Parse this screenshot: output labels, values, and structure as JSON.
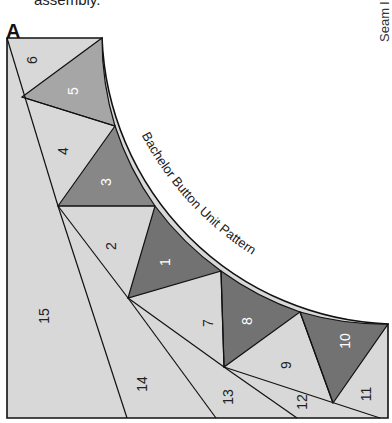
{
  "caption_fragment": "assembly.",
  "side_note": "Seam l",
  "section_label": "A",
  "pattern_title": "Bachelor Button Unit Pattern",
  "colors": {
    "light": "#d8d8d8",
    "medium": "#a6a6a6",
    "medium_dark": "#878787",
    "dark": "#727272",
    "line": "#111111",
    "label_dark_on_light": "#222222",
    "label_light_on_dark": "#ffffff"
  },
  "pieces": [
    {
      "id": "1",
      "label": "1",
      "shade": "dark"
    },
    {
      "id": "2",
      "label": "2",
      "shade": "light"
    },
    {
      "id": "3",
      "label": "3",
      "shade": "medium_dark"
    },
    {
      "id": "4",
      "label": "4",
      "shade": "light"
    },
    {
      "id": "5",
      "label": "5",
      "shade": "medium"
    },
    {
      "id": "6",
      "label": "6",
      "shade": "light"
    },
    {
      "id": "7",
      "label": "7",
      "shade": "light"
    },
    {
      "id": "8",
      "label": "8",
      "shade": "dark"
    },
    {
      "id": "9",
      "label": "9",
      "shade": "light"
    },
    {
      "id": "10",
      "label": "10",
      "shade": "dark"
    },
    {
      "id": "11",
      "label": "11",
      "shade": "light"
    },
    {
      "id": "12",
      "label": "12",
      "shade": "light"
    },
    {
      "id": "13",
      "label": "13",
      "shade": "light"
    },
    {
      "id": "14",
      "label": "14",
      "shade": "light"
    },
    {
      "id": "15",
      "label": "15",
      "shade": "light"
    }
  ]
}
